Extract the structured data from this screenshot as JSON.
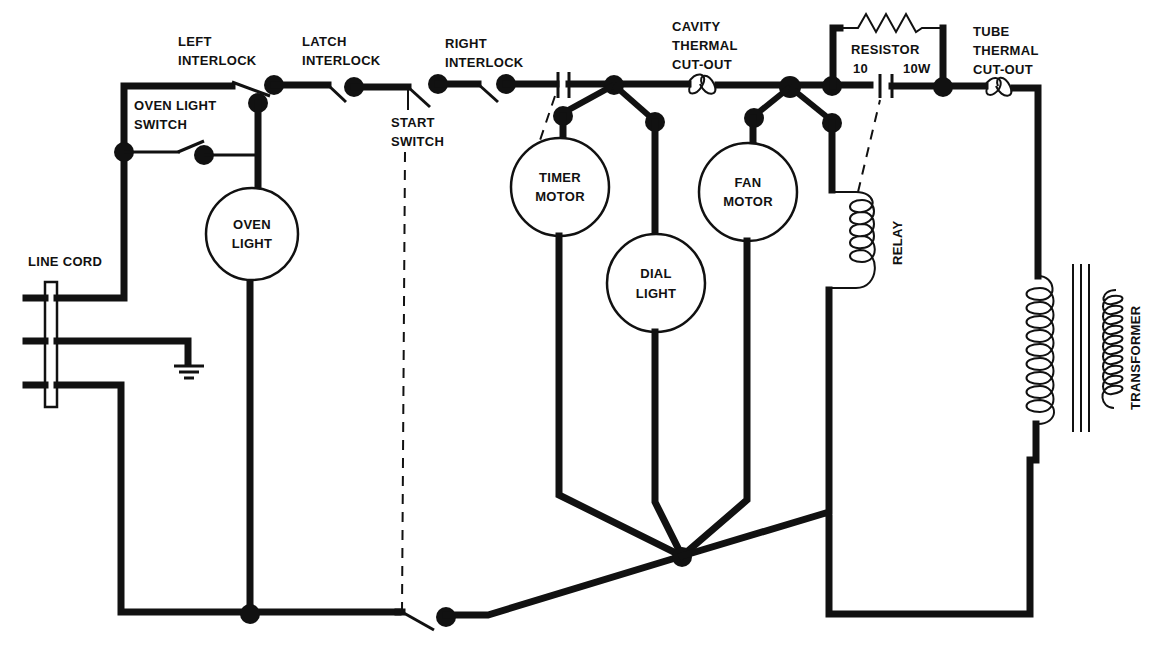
{
  "diagram": {
    "type": "electrical-schematic",
    "colors": {
      "ink": "#111111",
      "background": "#ffffff"
    },
    "labels": {
      "left_interlock": [
        "LEFT",
        "INTERLOCK"
      ],
      "latch_interlock": [
        "LATCH",
        "INTERLOCK"
      ],
      "right_interlock": [
        "RIGHT",
        "INTERLOCK"
      ],
      "oven_light_switch": [
        "OVEN LIGHT",
        "SWITCH"
      ],
      "start_switch": [
        "START",
        "SWITCH"
      ],
      "cavity_thermal_cutout": [
        "CAVITY",
        "THERMAL",
        "CUT-OUT"
      ],
      "resistor": [
        "RESISTOR",
        "10",
        "10W"
      ],
      "tube_thermal_cutout": [
        "TUBE",
        "THERMAL",
        "CUT-OUT"
      ],
      "line_cord": "LINE CORD",
      "relay": "RELAY",
      "transformer": "TRANSFORMER"
    },
    "components": {
      "oven_light": [
        "OVEN",
        "LIGHT"
      ],
      "timer_motor": [
        "TIMER",
        "MOTOR"
      ],
      "dial_light": [
        "DIAL",
        "LIGHT"
      ],
      "fan_motor": [
        "FAN",
        "MOTOR"
      ]
    }
  }
}
